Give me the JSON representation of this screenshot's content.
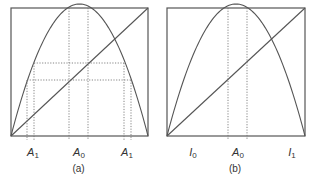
{
  "figure": {
    "panels": [
      {
        "id": "a",
        "caption": "(a)",
        "box": {
          "x0": 11,
          "y0": 8,
          "x1": 148,
          "y1": 136
        },
        "peak_y": 4,
        "labels": [
          {
            "base": "A",
            "sub": "1",
            "x": 33
          },
          {
            "base": "A",
            "sub": "0",
            "x": 79
          },
          {
            "base": "A",
            "sub": "1",
            "x": 127
          }
        ],
        "vertical_dotted": [
          {
            "x": 69,
            "from": 8
          },
          {
            "x": 88,
            "from": 8
          },
          {
            "x": 34,
            "from": 63
          },
          {
            "x": 124,
            "from": 63
          },
          {
            "x": 27,
            "from": 80
          },
          {
            "x": 131,
            "from": 80
          }
        ],
        "horizontal_dotted": [
          {
            "y": 63,
            "x0": 34,
            "x1": 124
          },
          {
            "y": 80,
            "x0": 27,
            "x1": 131
          }
        ]
      },
      {
        "id": "b",
        "caption": "(b)",
        "box": {
          "x0": 167,
          "y0": 8,
          "x1": 305,
          "y1": 136
        },
        "peak_y": 4,
        "labels": [
          {
            "base": "I",
            "sub": "0",
            "x": 193
          },
          {
            "base": "A",
            "sub": "0",
            "x": 238
          },
          {
            "base": "I",
            "sub": "1",
            "x": 292
          }
        ],
        "vertical_dotted": [
          {
            "x": 228,
            "from": 8
          },
          {
            "x": 247,
            "from": 8
          }
        ],
        "horizontal_dotted": []
      }
    ],
    "colors": {
      "line": "#555555",
      "dotted": "#777777",
      "text": "#333333"
    }
  }
}
